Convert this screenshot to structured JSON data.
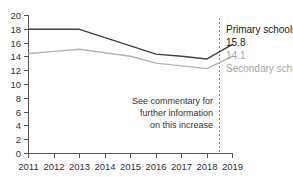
{
  "chart_data": {
    "type": "line",
    "title": "",
    "subtitle": "",
    "xlabel": "",
    "ylabel": "",
    "x": [
      2011,
      2012,
      2013,
      2014,
      2015,
      2016,
      2017,
      2018,
      2019
    ],
    "categories": [
      "2011",
      "2012",
      "2013",
      "2014",
      "2015",
      "2016",
      "2017",
      "2018",
      "2019"
    ],
    "xlim": [
      2011,
      2019
    ],
    "ylim": [
      0,
      20
    ],
    "ytick_values": [
      0,
      2,
      4,
      6,
      8,
      10,
      12,
      14,
      16,
      18,
      20
    ],
    "ytick_labels": [
      "0",
      "2",
      "4",
      "6",
      "8",
      "10",
      "12",
      "14",
      "16",
      "18",
      "20"
    ],
    "grid": false,
    "legend_position": "right-inline",
    "series": [
      {
        "name": "Primary schools",
        "color": "#404040",
        "values": [
          18.0,
          18.0,
          18.0,
          16.8,
          15.6,
          14.4,
          14.1,
          13.7,
          15.8
        ],
        "end_label": "15.8"
      },
      {
        "name": "Secondary schools",
        "color": "#b3b3b3",
        "values": [
          14.5,
          14.8,
          15.1,
          14.6,
          14.1,
          13.1,
          12.7,
          12.3,
          14.1
        ],
        "end_label": "14.1"
      }
    ],
    "annotations": [
      {
        "name": "commentary-note",
        "lines": [
          "See commentary for",
          "further information",
          "on this increase"
        ]
      },
      {
        "name": "break-divider",
        "at_x": 2018.5,
        "style": "dashed-vertical"
      }
    ]
  },
  "legend": {
    "primary_name": "Primary schools",
    "primary_value": "15.8",
    "secondary_value": "14.1",
    "secondary_name": "Secondary schools"
  },
  "colors": {
    "primary_line": "#404040",
    "secondary_line": "#b3b3b3",
    "axis": "#555555",
    "divider": "#888888",
    "text": "#333333",
    "secondary_text": "#a6a6a6",
    "background": "#ffffff"
  }
}
